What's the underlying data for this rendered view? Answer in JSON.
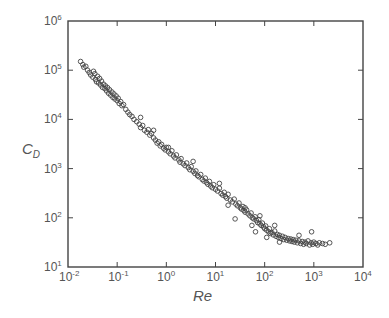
{
  "chart_data": {
    "type": "scatter",
    "title": "",
    "xlabel": "Re",
    "ylabel": "C_D",
    "xscale": "log",
    "yscale": "log",
    "xlim": [
      0.01,
      10000
    ],
    "ylim": [
      10,
      1000000
    ],
    "grid": false,
    "legend": null,
    "x_ticks": [
      {
        "base": "10",
        "exp": "-2"
      },
      {
        "base": "10",
        "exp": "-1"
      },
      {
        "base": "10",
        "exp": "0"
      },
      {
        "base": "10",
        "exp": "1"
      },
      {
        "base": "10",
        "exp": "2"
      },
      {
        "base": "10",
        "exp": "3"
      },
      {
        "base": "10",
        "exp": "4"
      }
    ],
    "y_ticks": [
      {
        "base": "10",
        "exp": "1"
      },
      {
        "base": "10",
        "exp": "2"
      },
      {
        "base": "10",
        "exp": "3"
      },
      {
        "base": "10",
        "exp": "4"
      },
      {
        "base": "10",
        "exp": "5"
      },
      {
        "base": "10",
        "exp": "6"
      }
    ],
    "marker": "open-circle",
    "marker_color": "#444444",
    "trend": [
      [
        0.018,
        150000
      ],
      [
        0.045,
        63000
      ],
      [
        0.114,
        25000
      ],
      [
        0.37,
        7700
      ],
      [
        0.74,
        3000
      ],
      [
        1.9,
        1500
      ],
      [
        4.9,
        640
      ],
      [
        12.3,
        290
      ],
      [
        31,
        140
      ],
      [
        80,
        63
      ],
      [
        200,
        43
      ],
      [
        520,
        36
      ],
      [
        2100,
        31
      ]
    ],
    "series": [
      {
        "name": "C_D vs Re",
        "points": [
          [
            0.018,
            150000
          ],
          [
            0.02,
            130000
          ],
          [
            0.021,
            115000
          ],
          [
            0.023,
            120000
          ],
          [
            0.025,
            100000
          ],
          [
            0.027,
            90000
          ],
          [
            0.029,
            80000
          ],
          [
            0.032,
            72000
          ],
          [
            0.033,
            95000
          ],
          [
            0.035,
            85000
          ],
          [
            0.036,
            65000
          ],
          [
            0.038,
            58000
          ],
          [
            0.04,
            75000
          ],
          [
            0.042,
            55000
          ],
          [
            0.044,
            68000
          ],
          [
            0.046,
            50000
          ],
          [
            0.048,
            60000
          ],
          [
            0.05,
            45000
          ],
          [
            0.053,
            52000
          ],
          [
            0.056,
            42000
          ],
          [
            0.058,
            48000
          ],
          [
            0.061,
            38000
          ],
          [
            0.064,
            44000
          ],
          [
            0.067,
            34000
          ],
          [
            0.07,
            40000
          ],
          [
            0.074,
            31000
          ],
          [
            0.078,
            36000
          ],
          [
            0.082,
            28000
          ],
          [
            0.086,
            33000
          ],
          [
            0.09,
            26000
          ],
          [
            0.095,
            30000
          ],
          [
            0.1,
            24000
          ],
          [
            0.105,
            27000
          ],
          [
            0.11,
            21000
          ],
          [
            0.118,
            23000
          ],
          [
            0.125,
            19000
          ],
          [
            0.135,
            20000
          ],
          [
            0.15,
            16000
          ],
          [
            0.165,
            14000
          ],
          [
            0.18,
            12500
          ],
          [
            0.2,
            11500
          ],
          [
            0.22,
            10000
          ],
          [
            0.25,
            9000
          ],
          [
            0.28,
            8000
          ],
          [
            0.3,
            6800
          ],
          [
            0.33,
            7500
          ],
          [
            0.36,
            6000
          ],
          [
            0.4,
            5500
          ],
          [
            0.43,
            6200
          ],
          [
            0.46,
            4800
          ],
          [
            0.5,
            5200
          ],
          [
            0.55,
            4200
          ],
          [
            0.6,
            3800
          ],
          [
            0.65,
            3300
          ],
          [
            0.7,
            3500
          ],
          [
            0.75,
            2900
          ],
          [
            0.8,
            3100
          ],
          [
            0.88,
            2600
          ],
          [
            0.95,
            2400
          ],
          [
            1.0,
            2700
          ],
          [
            1.1,
            2200
          ],
          [
            1.2,
            2000
          ],
          [
            1.3,
            2300
          ],
          [
            1.4,
            1800
          ],
          [
            1.5,
            1650
          ],
          [
            1.6,
            1900
          ],
          [
            1.8,
            1500
          ],
          [
            1.9,
            1350
          ],
          [
            2.0,
            1600
          ],
          [
            2.2,
            1250
          ],
          [
            2.4,
            1150
          ],
          [
            2.6,
            1300
          ],
          [
            2.8,
            1050
          ],
          [
            3.0,
            950
          ],
          [
            3.2,
            1100
          ],
          [
            3.5,
            880
          ],
          [
            3.8,
            800
          ],
          [
            4.0,
            900
          ],
          [
            4.3,
            720
          ],
          [
            4.6,
            680
          ],
          [
            5.0,
            760
          ],
          [
            5.4,
            600
          ],
          [
            5.8,
            560
          ],
          [
            6.2,
            640
          ],
          [
            6.6,
            520
          ],
          [
            7.0,
            480
          ],
          [
            7.5,
            550
          ],
          [
            8.0,
            440
          ],
          [
            8.6,
            410
          ],
          [
            9.2,
            470
          ],
          [
            10,
            380
          ],
          [
            11,
            350
          ],
          [
            12,
            400
          ],
          [
            13,
            310
          ],
          [
            14,
            290
          ],
          [
            15,
            330
          ],
          [
            16,
            270
          ],
          [
            17,
            250
          ],
          [
            18,
            300
          ],
          [
            20,
            230
          ],
          [
            22,
            210
          ],
          [
            24,
            240
          ],
          [
            26,
            190
          ],
          [
            28,
            175
          ],
          [
            30,
            200
          ],
          [
            32,
            160
          ],
          [
            34,
            150
          ],
          [
            36,
            170
          ],
          [
            38,
            140
          ],
          [
            40,
            130
          ],
          [
            43,
            145
          ],
          [
            46,
            120
          ],
          [
            50,
            110
          ],
          [
            53,
            125
          ],
          [
            56,
            100
          ],
          [
            60,
            95
          ],
          [
            64,
            105
          ],
          [
            68,
            88
          ],
          [
            72,
            80
          ],
          [
            76,
            92
          ],
          [
            80,
            75
          ],
          [
            85,
            70
          ],
          [
            90,
            78
          ],
          [
            95,
            65
          ],
          [
            100,
            60
          ],
          [
            105,
            68
          ],
          [
            110,
            56
          ],
          [
            120,
            52
          ],
          [
            125,
            60
          ],
          [
            130,
            48
          ],
          [
            140,
            50
          ],
          [
            150,
            45
          ],
          [
            160,
            54
          ],
          [
            170,
            42
          ],
          [
            180,
            46
          ],
          [
            190,
            40
          ],
          [
            200,
            44
          ],
          [
            215,
            38
          ],
          [
            230,
            42
          ],
          [
            245,
            36
          ],
          [
            260,
            40
          ],
          [
            280,
            35
          ],
          [
            300,
            38
          ],
          [
            320,
            34
          ],
          [
            340,
            37
          ],
          [
            360,
            33
          ],
          [
            380,
            36
          ],
          [
            400,
            32
          ],
          [
            430,
            35
          ],
          [
            460,
            31
          ],
          [
            500,
            34
          ],
          [
            540,
            30
          ],
          [
            580,
            33
          ],
          [
            620,
            29
          ],
          [
            660,
            32
          ],
          [
            700,
            30
          ],
          [
            760,
            34
          ],
          [
            820,
            28
          ],
          [
            880,
            31
          ],
          [
            950,
            29
          ],
          [
            1000,
            32
          ],
          [
            1100,
            30
          ],
          [
            1200,
            28
          ],
          [
            1300,
            31
          ],
          [
            1500,
            30
          ],
          [
            1700,
            29
          ],
          [
            2100,
            31
          ],
          [
            0.3,
            11000
          ],
          [
            0.55,
            6000
          ],
          [
            1.1,
            2700
          ],
          [
            3.5,
            1400
          ],
          [
            12,
            500
          ],
          [
            40,
            160
          ],
          [
            80,
            110
          ],
          [
            160,
            70
          ],
          [
            500,
            44
          ],
          [
            900,
            52
          ],
          [
            25,
            95
          ],
          [
            55,
            70
          ],
          [
            110,
            40
          ],
          [
            200,
            32
          ],
          [
            65,
            52
          ],
          [
            18,
            180
          ]
        ]
      }
    ]
  }
}
